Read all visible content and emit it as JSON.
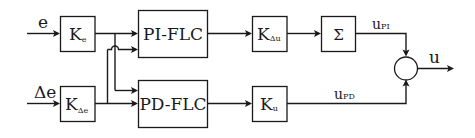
{
  "diagram": {
    "type": "block-diagram",
    "inputs": {
      "e": {
        "label": "e"
      },
      "de": {
        "label": "Δe"
      }
    },
    "gains": {
      "ke": {
        "base": "K",
        "sub": "e"
      },
      "kde": {
        "base": "K",
        "sub": "Δe"
      },
      "kdu": {
        "base": "K",
        "sub": "Δu"
      },
      "ku": {
        "base": "K",
        "sub": "u"
      }
    },
    "controllers": {
      "pi": {
        "label": "PI-FLC"
      },
      "pd": {
        "label": "PD-FLC"
      }
    },
    "integrator": {
      "label": "Σ"
    },
    "signals": {
      "upi": {
        "base": "u",
        "sub": "PI"
      },
      "upd": {
        "base": "u",
        "sub": "PD"
      },
      "u": {
        "label": "u"
      }
    },
    "summing_junction": {
      "label": ""
    },
    "connections": [
      [
        "e",
        "Ke"
      ],
      [
        "Δe",
        "KΔe"
      ],
      [
        "Ke",
        "PI-FLC"
      ],
      [
        "Ke",
        "PD-FLC"
      ],
      [
        "KΔe",
        "PI-FLC"
      ],
      [
        "KΔe",
        "PD-FLC"
      ],
      [
        "PI-FLC",
        "KΔu"
      ],
      [
        "KΔu",
        "Σ"
      ],
      [
        "Σ",
        "sum (uPI)"
      ],
      [
        "PD-FLC",
        "Ku"
      ],
      [
        "Ku",
        "sum (uPD)"
      ],
      [
        "sum",
        "u"
      ]
    ]
  }
}
